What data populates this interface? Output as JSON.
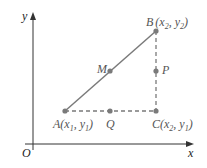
{
  "axes": {
    "x_label": "x",
    "y_label": "y",
    "origin_label": "O"
  },
  "points": {
    "A": {
      "name": "A",
      "coords": "(x",
      "sub1": "1",
      "mid": ", y",
      "sub2": "1",
      "end": ")"
    },
    "B": {
      "name": "B",
      "coords": "(x",
      "sub1": "2",
      "mid": ", y",
      "sub2": "2",
      "end": ")"
    },
    "C": {
      "name": "C",
      "coords": "(x",
      "sub1": "2",
      "mid": ", y",
      "sub2": "1",
      "end": ")"
    },
    "M": {
      "name": "M"
    },
    "P": {
      "name": "P"
    },
    "Q": {
      "name": "Q"
    }
  },
  "colors": {
    "axis": "#333333",
    "line": "#7a7a7a",
    "point": "#7a7a7a",
    "label": "#555555"
  }
}
